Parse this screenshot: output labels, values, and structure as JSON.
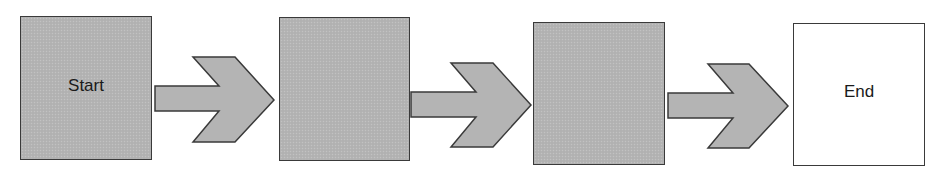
{
  "diagram": {
    "type": "flow",
    "direction": "left-to-right",
    "colors": {
      "box_fill": "#b4b4b4",
      "end_fill": "#ffffff",
      "stroke": "#3a3a3a",
      "text": "#1a1a1a"
    },
    "nodes": [
      {
        "id": "start",
        "label": "Start",
        "fill": "gray"
      },
      {
        "id": "step-2",
        "label": "",
        "fill": "gray"
      },
      {
        "id": "step-3",
        "label": "",
        "fill": "gray"
      },
      {
        "id": "end",
        "label": "End",
        "fill": "white"
      }
    ],
    "edges": [
      {
        "from": "start",
        "to": "step-2",
        "style": "block-arrow"
      },
      {
        "from": "step-2",
        "to": "step-3",
        "style": "block-arrow"
      },
      {
        "from": "step-3",
        "to": "end",
        "style": "block-arrow"
      }
    ]
  }
}
